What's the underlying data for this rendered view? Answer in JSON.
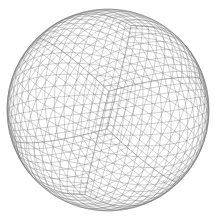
{
  "figure": {
    "background": "#ffffff",
    "line_color": "#6e6e6e",
    "line_opacity": 0.55,
    "line_width": 0.6,
    "center": [
      108,
      110
    ],
    "radius": 101,
    "subdivisions": 16,
    "rotation_deg": {
      "x": 32,
      "y": 38,
      "z": 8
    }
  }
}
